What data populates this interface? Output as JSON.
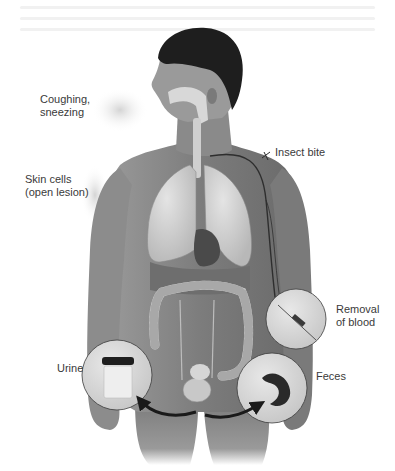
{
  "figure": {
    "style": "grayscale anatomical illustration",
    "colors": {
      "background": "#ffffff",
      "skin": "#8a8a8a",
      "skin_dark": "#5e5e5e",
      "hair": "#1e1e1e",
      "organ_light": "#d4d4d4",
      "organ_mid": "#b3b3b3",
      "organ_dark": "#4a4a4a",
      "inset_fill": "#d9d9d9",
      "inset_stroke": "#3c3c3c",
      "arrow": "#1a1a1a",
      "label_text": "#3a3a3a",
      "spray": "#c8c8c8"
    }
  },
  "labels": {
    "coughing": "Coughing,\nsneezing",
    "skin_cells": "Skin cells\n(open lesion)",
    "insect_bite": "Insect bite",
    "removal_of_blood": "Removal\nof blood",
    "urine": "Urine",
    "feces": "Feces"
  },
  "insets": [
    {
      "name": "urine-specimen",
      "depicts": "specimen cup with dark lid"
    },
    {
      "name": "blood-draw",
      "depicts": "syringe needle in arm"
    },
    {
      "name": "feces-specimen",
      "depicts": "dark stool sample"
    }
  ]
}
